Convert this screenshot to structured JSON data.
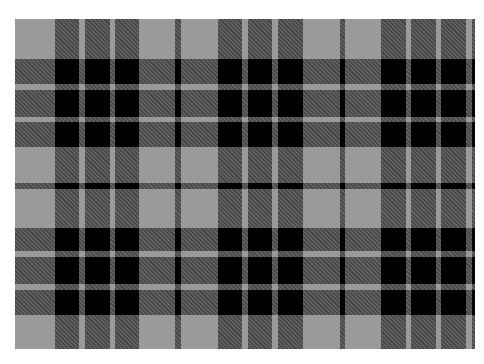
{
  "image": {
    "subject": "Grey and black tartan plaid fabric pattern",
    "colors": {
      "background": "#ffffff",
      "gray": "#9a9a9a",
      "dark_hatch": "#3a3a3a",
      "black": "#000000",
      "light_stripe": "#a4a4a4"
    },
    "pattern_box": {
      "x": 15,
      "y": 19,
      "width": 460,
      "height": 330
    },
    "vertical_dark_bands": [
      {
        "x": 40,
        "w": 24
      },
      {
        "x": 70,
        "w": 25
      },
      {
        "x": 100,
        "w": 24
      },
      {
        "x": 160,
        "w": 6
      },
      {
        "x": 203,
        "w": 24
      },
      {
        "x": 233,
        "w": 24
      },
      {
        "x": 263,
        "w": 25
      },
      {
        "x": 325,
        "w": 5
      },
      {
        "x": 366,
        "w": 25
      },
      {
        "x": 396,
        "w": 25
      },
      {
        "x": 426,
        "w": 25
      },
      {
        "x": 457,
        "w": 3
      }
    ],
    "horizontal_dark_bands": [
      {
        "y": 40,
        "h": 25
      },
      {
        "y": 71,
        "h": 27
      },
      {
        "y": 103,
        "h": 25
      },
      {
        "y": 164,
        "h": 6
      },
      {
        "y": 209,
        "h": 23
      },
      {
        "y": 238,
        "h": 27
      },
      {
        "y": 271,
        "h": 25
      }
    ],
    "black_blocks": {
      "columns": [
        {
          "x": 40,
          "w": 84
        },
        {
          "x": 203,
          "w": 85
        },
        {
          "x": 366,
          "w": 85
        }
      ],
      "rows": [
        {
          "y": 40,
          "h": 88
        },
        {
          "y": 209,
          "h": 87
        }
      ]
    }
  }
}
